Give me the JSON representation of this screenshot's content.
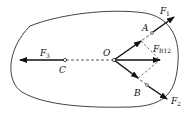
{
  "diagram": {
    "labels": {
      "origin": "O",
      "point_a": "A",
      "point_b": "B",
      "point_c": "C",
      "f1_main": "F",
      "f1_sub": "1",
      "f2_main": "F",
      "f2_sub": "2",
      "f3_main": "F",
      "f3_sub": "3",
      "fr12_main": "F",
      "fr12_sub": "R12"
    },
    "colors": {
      "stroke": "#111111",
      "background": "#ffffff"
    }
  }
}
